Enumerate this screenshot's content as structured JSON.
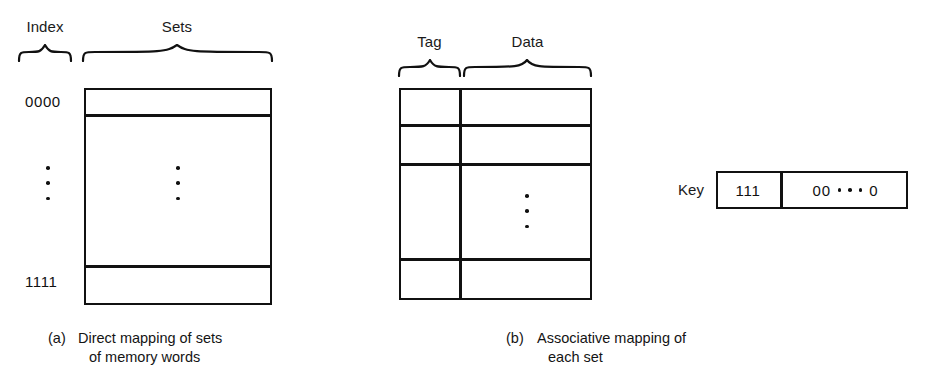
{
  "figure": {
    "panel_a": {
      "col_label_index": "Index",
      "col_label_sets": "Sets",
      "row_first_label": "0000",
      "row_last_label": "1111",
      "ellipsis_glyph": "vertical-ellipsis",
      "caption_marker": "(a)",
      "caption_line1": "Direct mapping of sets",
      "caption_line2": "of memory words"
    },
    "panel_b": {
      "col_label_tag": "Tag",
      "col_label_data": "Data",
      "ellipsis_glyph": "vertical-ellipsis",
      "caption_marker": "(b)",
      "caption_line1": "Associative mapping of",
      "caption_line2": "each set"
    },
    "key": {
      "label": "Key",
      "tag_value": "111",
      "data_prefix": "00",
      "data_suffix": "0",
      "data_ellipsis": "horizontal-ellipsis"
    },
    "colors": {
      "ink": "#111111",
      "background": "#ffffff"
    }
  }
}
